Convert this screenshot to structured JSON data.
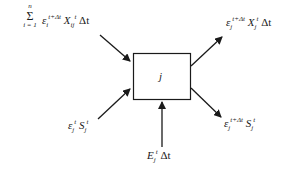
{
  "diagram": {
    "type": "flow-balance",
    "node": {
      "id": "j",
      "label": "j"
    },
    "colors": {
      "stroke": "#1a1a1a",
      "background": "#ffffff"
    },
    "edges": [
      {
        "id": "in-top-left",
        "direction": "in",
        "label": {
          "sum_symbol": "Σ",
          "sum_upper": "n",
          "sum_lower": "i = 1",
          "base1": "ε",
          "base1_sub": "i",
          "base1_sup": "t+Δt",
          "base2": "X",
          "base2_sub": "ij",
          "base2_sup": "t",
          "tail": "Δt"
        }
      },
      {
        "id": "in-bottom-left",
        "direction": "in",
        "label": {
          "base1": "ε",
          "base1_sub": "j",
          "base1_sup": "t",
          "base2": "S",
          "base2_sub": "j",
          "base2_sup": "t"
        }
      },
      {
        "id": "in-bottom",
        "direction": "in",
        "label": {
          "base1": "E",
          "base1_sub": "j",
          "base1_sup": "t",
          "tail": "Δt"
        }
      },
      {
        "id": "out-top-right",
        "direction": "out",
        "label": {
          "base1": "ε",
          "base1_sub": "j",
          "base1_sup": "t+Δt",
          "base2": "X",
          "base2_sub": "j",
          "base2_sup": "t",
          "tail": "Δt"
        }
      },
      {
        "id": "out-bottom-right",
        "direction": "out",
        "label": {
          "base1": "ε",
          "base1_sub": "j",
          "base1_sup": "t+Δt",
          "base2": "S",
          "base2_sub": "j",
          "base2_sup": "t"
        }
      }
    ]
  }
}
